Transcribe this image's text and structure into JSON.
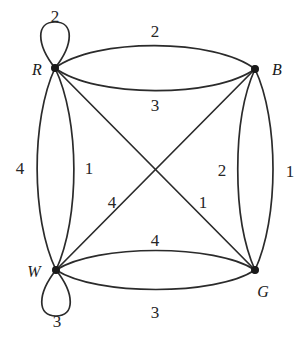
{
  "figure": {
    "type": "labeled-multigraph",
    "background_color": "#ffffff",
    "stroke_color": "#2b2b2b",
    "vertex_color": "#1a1a1a"
  },
  "vertices": [
    {
      "id": "R",
      "label": "R",
      "x": 55,
      "y": 68,
      "label_x": 37,
      "label_y": 70
    },
    {
      "id": "B",
      "label": "B",
      "x": 255,
      "y": 69,
      "label_x": 277,
      "label_y": 70
    },
    {
      "id": "W",
      "label": "W",
      "x": 56,
      "y": 270,
      "label_x": 34,
      "label_y": 272
    },
    {
      "id": "G",
      "label": "G",
      "x": 255,
      "y": 270,
      "label_x": 263,
      "label_y": 292
    }
  ],
  "edges": [
    {
      "from": "R",
      "to": "R",
      "weight": "2",
      "kind": "self-loop",
      "label_x": 55,
      "label_y": 16
    },
    {
      "from": "W",
      "to": "W",
      "weight": "3",
      "kind": "self-loop",
      "label_x": 57,
      "label_y": 321
    },
    {
      "from": "R",
      "to": "B",
      "weight": "2",
      "kind": "arc-upper",
      "label_x": 155,
      "label_y": 31
    },
    {
      "from": "R",
      "to": "B",
      "weight": "3",
      "kind": "arc-lower",
      "label_x": 155,
      "label_y": 105
    },
    {
      "from": "R",
      "to": "W",
      "weight": "4",
      "kind": "arc-left",
      "label_x": 20,
      "label_y": 168
    },
    {
      "from": "R",
      "to": "W",
      "weight": "1",
      "kind": "arc-right",
      "label_x": 89,
      "label_y": 168
    },
    {
      "from": "B",
      "to": "G",
      "weight": "2",
      "kind": "arc-left",
      "label_x": 222,
      "label_y": 170
    },
    {
      "from": "B",
      "to": "G",
      "weight": "1",
      "kind": "arc-right",
      "label_x": 290,
      "label_y": 171
    },
    {
      "from": "W",
      "to": "G",
      "weight": "4",
      "kind": "arc-upper",
      "label_x": 155,
      "label_y": 240
    },
    {
      "from": "W",
      "to": "G",
      "weight": "3",
      "kind": "arc-lower",
      "label_x": 155,
      "label_y": 312
    },
    {
      "from": "B",
      "to": "W",
      "weight": "4",
      "kind": "diagonal",
      "label_x": 112,
      "label_y": 202
    },
    {
      "from": "R",
      "to": "G",
      "weight": "1",
      "kind": "diagonal",
      "label_x": 203,
      "label_y": 202
    }
  ],
  "geometry": {
    "paths": [
      "M 55 68 C 36 44, 36 22, 55 22 C 74 22, 74 44, 55 68",
      "M 56 270 C 37 294, 37 316, 56 316 C 75 316, 75 294, 56 270",
      "M 55 68 C 95 38, 215 38, 255 69",
      "M 55 68 C 95 98, 215 98, 255 69",
      "M 55 68 C 31 120, 31 218, 56 270",
      "M 55 68 C 80 120, 80 218, 56 270",
      "M 255 69 C 232 120, 232 218, 255 270",
      "M 255 69 C 279 120, 279 218, 255 270",
      "M 56 270 C 96 244, 216 244, 255 270",
      "M 56 270 C 96 296, 216 296, 255 270",
      "M 255 69 L 56 270",
      "M 55 68 L 255 270"
    ]
  }
}
